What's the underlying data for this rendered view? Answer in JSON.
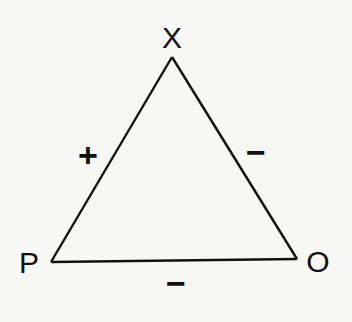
{
  "diagram": {
    "type": "signed-triangle",
    "vertices": [
      {
        "id": "X",
        "label": "X",
        "position": "top"
      },
      {
        "id": "P",
        "label": "P",
        "position": "bottom-left"
      },
      {
        "id": "O",
        "label": "O",
        "position": "bottom-right"
      }
    ],
    "edges": [
      {
        "from": "P",
        "to": "X",
        "sign": "+"
      },
      {
        "from": "X",
        "to": "O",
        "sign": "−"
      },
      {
        "from": "P",
        "to": "O",
        "sign": "−"
      }
    ],
    "colors": {
      "line": "#111111",
      "background": "#f7f7f5"
    }
  }
}
